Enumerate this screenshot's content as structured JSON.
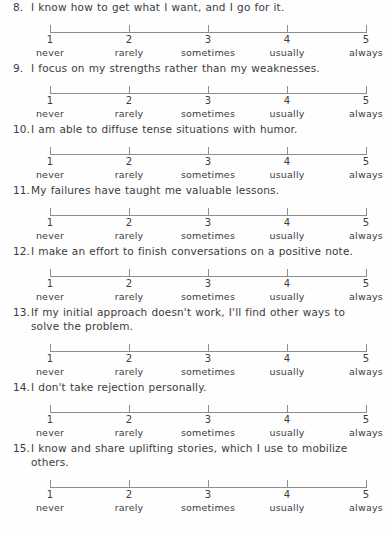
{
  "document": {
    "kind": "likert-questionnaire-page",
    "background_color": "#fefefe",
    "text_color": "#3c3c3c",
    "rule_color": "#8d8d8d"
  },
  "scale": {
    "tick_values": [
      "1",
      "2",
      "3",
      "4",
      "5"
    ],
    "anchors": [
      "never",
      "rarely",
      "sometimes",
      "usually",
      "always"
    ]
  },
  "items": [
    {
      "number": "8.",
      "text": "I know how to get what I want, and I go for it."
    },
    {
      "number": "9.",
      "text": "I focus on my strengths rather than my weaknesses."
    },
    {
      "number": "10.",
      "text": "I am able to diffuse tense situations with humor."
    },
    {
      "number": "11.",
      "text": "My failures have taught me valuable lessons."
    },
    {
      "number": "12.",
      "text": "I make an effort to finish conversations on a positive note."
    },
    {
      "number": "13.",
      "text": "If my initial approach doesn't work, I'll find other ways to solve the problem."
    },
    {
      "number": "14.",
      "text": "I don't take rejection personally."
    },
    {
      "number": "15.",
      "text": "I know and share uplifting stories, which I use to mobilize others."
    }
  ]
}
